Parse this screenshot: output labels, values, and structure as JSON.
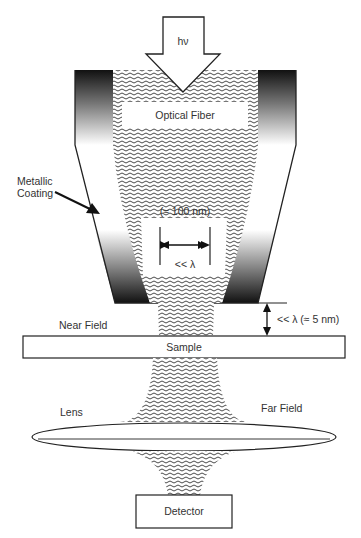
{
  "diagram": {
    "labels": {
      "photon": "hν",
      "optical_fiber": "Optical Fiber",
      "metallic_coating_line1": "Metallic",
      "metallic_coating_line2": "Coating",
      "aperture_size": "(≈ 100 nm)",
      "aperture_relation": "<< λ",
      "gap_distance": "<< λ (≈ 5 nm)",
      "near_field": "Near Field",
      "sample": "Sample",
      "lens": "Lens",
      "far_field": "Far Field",
      "detector": "Detector"
    },
    "colors": {
      "line": "#222222",
      "coating_dark": "#1a1a1a",
      "coating_light": "#ffffff",
      "text": "#333333",
      "background": "#ffffff"
    }
  }
}
